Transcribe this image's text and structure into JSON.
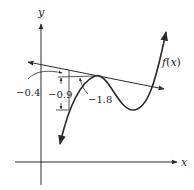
{
  "figure": {
    "axes": {
      "x_label": "x",
      "y_label": "y"
    },
    "curve": {
      "label": "f(x)",
      "description": "cubic-like curve with local max (tangent point) and local min"
    },
    "tangent_line": {
      "description": "secant/tangent line touching curve near local max"
    },
    "annotations": [
      {
        "id": "a1",
        "text": "-0.4"
      },
      {
        "id": "a2",
        "text": "-0.9"
      },
      {
        "id": "a3",
        "text": "-1.8"
      }
    ],
    "colors": {
      "stroke": "#2a2a2a",
      "background": "#ffffff"
    }
  }
}
